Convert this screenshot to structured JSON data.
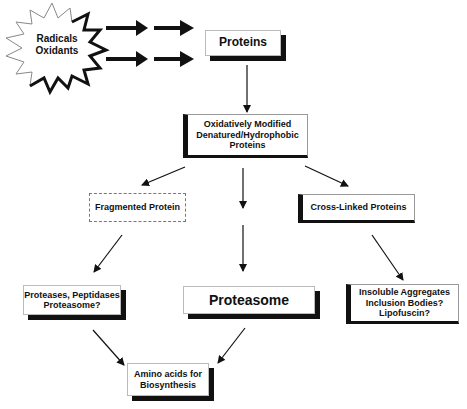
{
  "diagram": {
    "source": {
      "label": "Radicals\nOxidants"
    },
    "nodes": {
      "proteins": {
        "label": "Proteins"
      },
      "modified": {
        "label": "Oxidatively Modified\nDenatured/Hydrophobic\nProteins"
      },
      "fragmented": {
        "label": "Fragmented Protein"
      },
      "crosslinked": {
        "label": "Cross-Linked Proteins"
      },
      "proteases": {
        "label": "Proteases, Peptidases\nProteasome?"
      },
      "proteasome": {
        "label": "Proteasome"
      },
      "aggregates": {
        "label": "Insoluble Aggregates\nInclusion Bodies?\nLipofuscin?"
      },
      "aminoacids": {
        "label": "Amino acids for\nBiosynthesis"
      }
    },
    "edges": [
      {
        "from": "source",
        "to": "proteins"
      },
      {
        "from": "proteins",
        "to": "modified"
      },
      {
        "from": "modified",
        "to": "fragmented"
      },
      {
        "from": "modified",
        "to": "proteasome"
      },
      {
        "from": "modified",
        "to": "crosslinked"
      },
      {
        "from": "fragmented",
        "to": "proteases"
      },
      {
        "from": "crosslinked",
        "to": "aggregates"
      },
      {
        "from": "proteases",
        "to": "aminoacids"
      },
      {
        "from": "proteasome",
        "to": "aminoacids"
      }
    ]
  }
}
